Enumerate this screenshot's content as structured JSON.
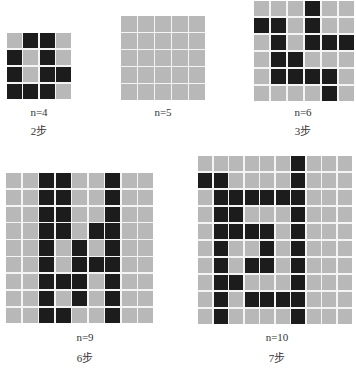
{
  "puzzles": [
    {
      "n_label": "n=4",
      "steps_label": "2步",
      "n": 4,
      "grid": [
        "0110",
        "1010",
        "1011",
        "1110"
      ]
    },
    {
      "n_label": "n=5",
      "steps_label": "",
      "n": 5,
      "grid": [
        "00000",
        "00000",
        "00000",
        "00000",
        "00000"
      ]
    },
    {
      "n_label": "n=6",
      "steps_label": "3步",
      "n": 6,
      "grid": [
        "000100",
        "110100",
        "010111",
        "011000",
        "011110",
        "000010"
      ]
    },
    {
      "n_label": "n=9",
      "steps_label": "6步",
      "n": 9,
      "grid": [
        "001100100",
        "001100100",
        "001100100",
        "001101100",
        "001010100",
        "001011100",
        "001110100",
        "001010100",
        "001100100"
      ]
    },
    {
      "n_label": "n=10",
      "steps_label": "7步",
      "n": 10,
      "grid": [
        "0000001000",
        "1100001000",
        "0111111000",
        "0110001000",
        "0111101000",
        "0100101000",
        "0101101000",
        "0110001000",
        "0101111000",
        "0100001000"
      ]
    }
  ],
  "colors": {
    "filled": "#1c1c1c",
    "empty": "#b8b8b8",
    "grid_line": "#f4f4f4"
  }
}
